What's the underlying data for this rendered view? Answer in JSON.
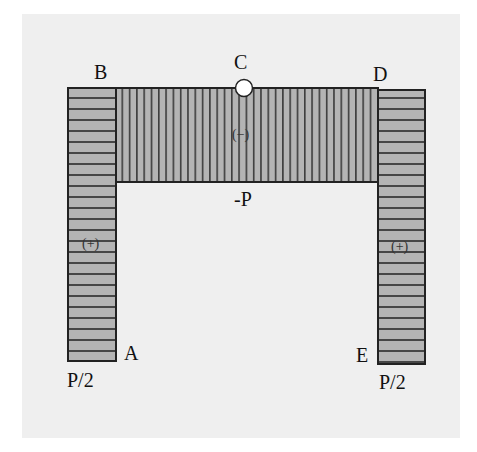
{
  "diagram": {
    "type": "axial-force-diagram",
    "colors": {
      "background_panel": "#efefef",
      "fill": "#b4b4b4",
      "hatch": "#2a2a2a",
      "outline": "#222222",
      "hinge_fill": "#ffffff"
    },
    "nodes": {
      "A": "A",
      "B": "B",
      "C": "C",
      "D": "D",
      "E": "E"
    },
    "members": {
      "left_column": {
        "from": "A",
        "to": "B",
        "sign": "(+)",
        "value": "P/2"
      },
      "beam": {
        "from": "B",
        "to": "D",
        "sign": "(−)",
        "value": "-P"
      },
      "right_column": {
        "from": "D",
        "to": "E",
        "sign": "(+)",
        "value": "P/2"
      }
    },
    "hinge": {
      "at": "C"
    }
  }
}
